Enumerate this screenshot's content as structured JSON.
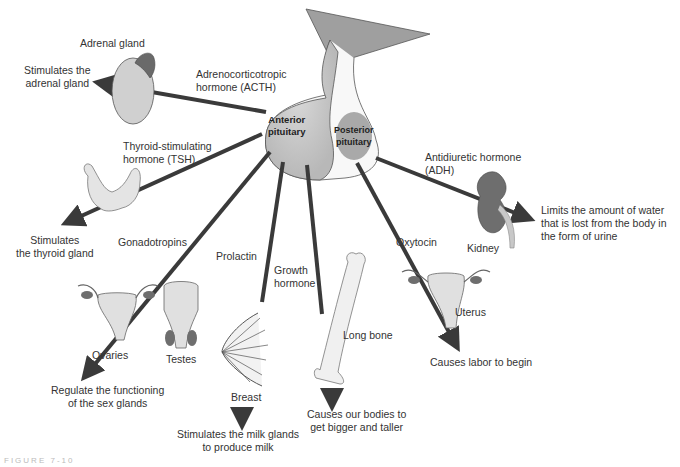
{
  "diagram": {
    "center": {
      "anterior": "Anterior\npituitary",
      "posterior": "Posterior\npituitary"
    },
    "hormones": {
      "acth": "Adrenocorticotropic\nhormone (ACTH)",
      "tsh": "Thyroid-stimulating\nhormone (TSH)",
      "gonadotropins": "Gonadotropins",
      "prolactin": "Prolactin",
      "growth": "Growth\nhormone",
      "oxytocin": "Oxytocin",
      "adh": "Antidiuretic hormone\n(ADH)"
    },
    "organs": {
      "adrenal": "Adrenal gland",
      "ovaries": "Ovaries",
      "testes": "Testes",
      "breast": "Breast",
      "long_bone": "Long bone",
      "uterus": "Uterus",
      "kidney": "Kidney"
    },
    "effects": {
      "adrenal": "Stimulates the\nadrenal gland",
      "thyroid": "Stimulates\nthe thyroid gland",
      "sex": "Regulate the functioning\nof the sex glands",
      "milk": "Stimulates the milk glands\nto produce milk",
      "growth": "Causes our bodies to\nget bigger and taller",
      "labor": "Causes labor to begin",
      "water": "Limits the amount of water\nthat is lost from the body in\nthe form of urine"
    },
    "figure_caption": "FIGURE 7-10",
    "colors": {
      "arrow": "#3a3a3a",
      "anterior_fill": "#c9c9c9",
      "posterior_fill": "#a9a9a9",
      "hypothalamus_fill": "#9f9f9f",
      "organ_light": "#dcdcdc",
      "organ_dark": "#6e6e6e"
    }
  }
}
